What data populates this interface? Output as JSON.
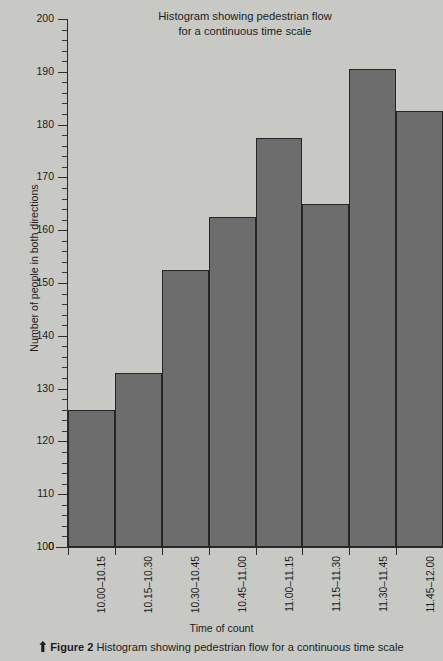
{
  "chart_data": {
    "type": "bar",
    "title": "Histogram showing pedestrian flow for a continuous time scale",
    "title_line1": "Histogram showing pedestrian flow",
    "title_line2": "for a continuous time scale",
    "xlabel": "Time of count",
    "ylabel": "Number of people in both directions",
    "categories": [
      "10.00–10.15",
      "10.15–10.30",
      "10.30–10.45",
      "10.45–11.00",
      "11.00–11.15",
      "11.15–11.30",
      "11.30–11.45",
      "11.45–12.00"
    ],
    "values": [
      126,
      133,
      152.5,
      162.5,
      177.5,
      165,
      190.5,
      182.5
    ],
    "ylim": [
      100,
      200
    ],
    "y_axis_break": true,
    "y_zero_tick": "0",
    "ytick_labels": [
      "100",
      "110",
      "120",
      "130",
      "140",
      "150",
      "160",
      "170",
      "180",
      "190",
      "200"
    ],
    "ytick_values": [
      100,
      110,
      120,
      130,
      140,
      150,
      160,
      170,
      180,
      190,
      200
    ],
    "minor_ticks_per_interval": 5,
    "grid": false,
    "legend": false,
    "bar_color": "#6d6d6d",
    "bar_edge_color": "#262626",
    "background_color": "#c8c9c4"
  },
  "caption": {
    "marker_icon": "up-arrow-marker-icon",
    "label": "Figure 2",
    "text": "Histogram showing pedestrian flow for a continuous time scale"
  }
}
